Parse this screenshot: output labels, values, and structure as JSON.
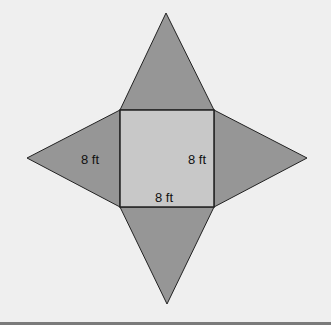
{
  "diagram": {
    "type": "pyramid-net",
    "colors": {
      "background": "#efefef",
      "base_fill": "#c8c8c8",
      "face_fill": "#969696",
      "stroke": "#222222"
    },
    "labels": {
      "left_face": "8 ft",
      "base_right": "8 ft",
      "base_bottom": "8 ft"
    }
  }
}
